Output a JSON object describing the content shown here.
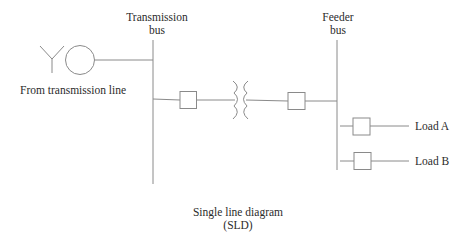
{
  "diagram": {
    "title_line1": "Single line diagram",
    "title_line2": "(SLD)",
    "transmission_bus": {
      "label_line1": "Transmission",
      "label_line2": "bus"
    },
    "feeder_bus": {
      "label_line1": "Feeder",
      "label_line2": "bus"
    },
    "source": {
      "label": "From transmission line",
      "icons": [
        "antenna-y-icon",
        "generator-circle-icon"
      ]
    },
    "components": [
      {
        "type": "circuit-breaker",
        "position": "transmission-side"
      },
      {
        "type": "transformer"
      },
      {
        "type": "circuit-breaker",
        "position": "feeder-side"
      }
    ],
    "loads": [
      {
        "label": "Load A"
      },
      {
        "label": "Load B"
      }
    ],
    "colors": {
      "line": "#8a8a8a",
      "text": "#2b2b2b",
      "background": "#ffffff"
    }
  }
}
